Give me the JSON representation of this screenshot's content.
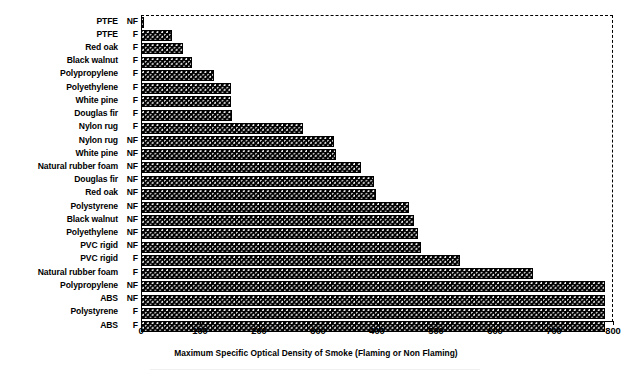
{
  "chart_data": {
    "type": "bar",
    "orientation": "horizontal",
    "title": "",
    "xlabel": "Maximum Specific Optical Density of Smoke (Flaming or Non Flaming)",
    "ylabel": "",
    "xlim": [
      0,
      800
    ],
    "ylim": null,
    "xticks": [
      0,
      100,
      200,
      300,
      400,
      500,
      600,
      700,
      800
    ],
    "xtick_labels": [
      "0",
      "100",
      "200",
      "300",
      "400",
      "500",
      "600",
      "700",
      "800"
    ],
    "grid": false,
    "legend": null,
    "bar_color": "#000000",
    "bar_pattern": "dense-dotted-hatch",
    "categories": [
      "PTFE NF",
      "PTFE F",
      "Red oak F",
      "Black walnut F",
      "Polypropylene F",
      "Polyethylene F",
      "White pine F",
      "Douglas fir F",
      "Nylon rug F",
      "Nylon rug NF",
      "White pine NF",
      "Natural rubber foam NF",
      "Douglas fir NF",
      "Red oak NF",
      "Polystyrene NF",
      "Black walnut NF",
      "Polyethylene NF",
      "PVC rigid NF",
      "PVC rigid F",
      "Natural rubber foam F",
      "Polypropylene NF",
      "ABS NF",
      "Polystyrene F",
      "ABS F"
    ],
    "values": [
      5,
      53,
      72,
      87,
      123,
      153,
      153,
      155,
      274,
      327,
      330,
      373,
      395,
      398,
      455,
      462,
      470,
      474,
      540,
      664,
      786,
      786,
      786,
      786
    ]
  },
  "axis": {
    "xlabel": "Maximum Specific Optical Density of Smoke (Flaming or Non Flaming)",
    "ticks": [
      {
        "value": "0"
      },
      {
        "value": "100"
      },
      {
        "value": "200"
      },
      {
        "value": "300"
      },
      {
        "value": "400"
      },
      {
        "value": "500"
      },
      {
        "value": "600"
      },
      {
        "value": "700"
      },
      {
        "value": "800"
      }
    ]
  },
  "rows": [
    {
      "name": "PTFE",
      "mode": "NF",
      "value": 5
    },
    {
      "name": "PTFE",
      "mode": "F",
      "value": 53
    },
    {
      "name": "Red oak",
      "mode": "F",
      "value": 72
    },
    {
      "name": "Black walnut",
      "mode": "F",
      "value": 87
    },
    {
      "name": "Polypropylene",
      "mode": "F",
      "value": 123
    },
    {
      "name": "Polyethylene",
      "mode": "F",
      "value": 153
    },
    {
      "name": "White pine",
      "mode": "F",
      "value": 153
    },
    {
      "name": "Douglas fir",
      "mode": "F",
      "value": 155
    },
    {
      "name": "Nylon rug",
      "mode": "F",
      "value": 274
    },
    {
      "name": "Nylon rug",
      "mode": "NF",
      "value": 327
    },
    {
      "name": "White pine",
      "mode": "NF",
      "value": 330
    },
    {
      "name": "Natural rubber foam",
      "mode": "NF",
      "value": 373
    },
    {
      "name": "Douglas fir",
      "mode": "NF",
      "value": 395
    },
    {
      "name": "Red oak",
      "mode": "NF",
      "value": 398
    },
    {
      "name": "Polystyrene",
      "mode": "NF",
      "value": 455
    },
    {
      "name": "Black walnut",
      "mode": "NF",
      "value": 462
    },
    {
      "name": "Polyethylene",
      "mode": "NF",
      "value": 470
    },
    {
      "name": "PVC rigid",
      "mode": "NF",
      "value": 474
    },
    {
      "name": "PVC rigid",
      "mode": "F",
      "value": 540
    },
    {
      "name": "Natural rubber foam",
      "mode": "F",
      "value": 664
    },
    {
      "name": "Polypropylene",
      "mode": "NF",
      "value": 786
    },
    {
      "name": "ABS",
      "mode": "NF",
      "value": 786
    },
    {
      "name": "Polystyrene",
      "mode": "F",
      "value": 786
    },
    {
      "name": "ABS",
      "mode": "F",
      "value": 786
    }
  ]
}
